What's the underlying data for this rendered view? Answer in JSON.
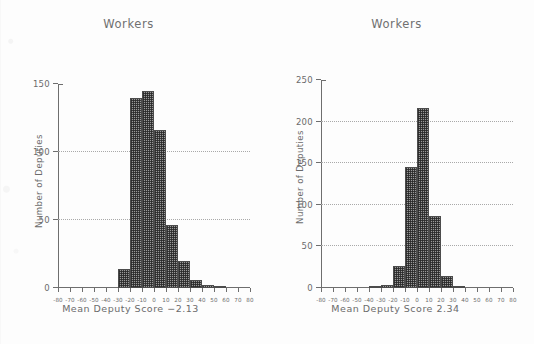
{
  "figure": {
    "background_color": "#fdfdfd",
    "ink_color": "#6b6b6b",
    "bar_fill_color": "#9a9a9a",
    "bar_edge_color": "#4c4c4c",
    "grid_color": "#a9a9a9"
  },
  "chart_data": [
    {
      "type": "bar",
      "panel": "left",
      "title": "Workers",
      "xlabel": "Mean Deputy Score −2.13",
      "ylabel": "Number of Deputies",
      "xlim": [
        -80,
        80
      ],
      "ylim": [
        0,
        150
      ],
      "grid": true,
      "grid_values": [
        50,
        100
      ],
      "legend": "none",
      "xticks": [
        -80,
        -70,
        -60,
        -50,
        -40,
        -30,
        -20,
        -10,
        0,
        10,
        20,
        30,
        40,
        50,
        60,
        70,
        80
      ],
      "xticklabels": [
        "-80",
        "-70",
        "-60",
        "-50",
        "-40",
        "-30",
        "-20",
        "-10",
        "0",
        "10",
        "20",
        "30",
        "40",
        "50",
        "60",
        "70",
        "80"
      ],
      "yticks": [
        0,
        50,
        100,
        150
      ],
      "yticklabels": [
        "0",
        "50",
        "100",
        "150"
      ],
      "bin_width": 10,
      "bins": [
        {
          "x0": -30,
          "x1": -20,
          "value": 14
        },
        {
          "x0": -20,
          "x1": -10,
          "value": 140
        },
        {
          "x0": -10,
          "x1": 0,
          "value": 145
        },
        {
          "x0": 0,
          "x1": 10,
          "value": 116
        },
        {
          "x0": 10,
          "x1": 20,
          "value": 46
        },
        {
          "x0": 20,
          "x1": 30,
          "value": 20
        },
        {
          "x0": 30,
          "x1": 40,
          "value": 6
        },
        {
          "x0": 40,
          "x1": 50,
          "value": 2
        },
        {
          "x0": 50,
          "x1": 60,
          "value": 1
        }
      ],
      "categories": [
        "-30",
        "-20",
        "-10",
        "0",
        "10",
        "20",
        "30",
        "40",
        "50"
      ],
      "values": [
        14,
        140,
        145,
        116,
        46,
        20,
        6,
        2,
        1
      ]
    },
    {
      "type": "bar",
      "panel": "right",
      "title": "Workers",
      "xlabel": "Mean Deputy Score 2.34",
      "ylabel": "Number of Deputies",
      "xlim": [
        -80,
        80
      ],
      "ylim": [
        0,
        250
      ],
      "grid": true,
      "grid_values": [
        50,
        100,
        150,
        200
      ],
      "legend": "none",
      "xticks": [
        -80,
        -70,
        -60,
        -50,
        -40,
        -30,
        -20,
        -10,
        0,
        10,
        20,
        30,
        40,
        50,
        60,
        70,
        80
      ],
      "xticklabels": [
        "-80",
        "-70",
        "-60",
        "-50",
        "-40",
        "-30",
        "-20",
        "-10",
        "0",
        "10",
        "20",
        "30",
        "40",
        "50",
        "60",
        "70",
        "80"
      ],
      "yticks": [
        0,
        50,
        100,
        150,
        200,
        250
      ],
      "yticklabels": [
        "0",
        "50",
        "100",
        "150",
        "200",
        "250"
      ],
      "bin_width": 10,
      "bins": [
        {
          "x0": -40,
          "x1": -30,
          "value": 1
        },
        {
          "x0": -30,
          "x1": -20,
          "value": 4
        },
        {
          "x0": -20,
          "x1": -10,
          "value": 26
        },
        {
          "x0": -10,
          "x1": 0,
          "value": 145
        },
        {
          "x0": 0,
          "x1": 10,
          "value": 216
        },
        {
          "x0": 10,
          "x1": 20,
          "value": 86
        },
        {
          "x0": 20,
          "x1": 30,
          "value": 14
        },
        {
          "x0": 30,
          "x1": 40,
          "value": 2
        }
      ],
      "categories": [
        "-40",
        "-30",
        "-20",
        "-10",
        "0",
        "10",
        "20",
        "30"
      ],
      "values": [
        1,
        4,
        26,
        145,
        216,
        86,
        14,
        2
      ]
    }
  ]
}
